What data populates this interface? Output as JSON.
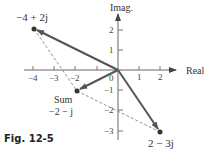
{
  "figure": {
    "caption": "Fig. 12-5",
    "axes": {
      "x_label": "Real",
      "y_label": "Imag.",
      "x_ticks": [
        "−4",
        "−3",
        "−2",
        "1",
        "2"
      ],
      "y_ticks": [
        "2",
        "1",
        "0",
        "−1",
        "−2",
        "−3"
      ]
    },
    "points": {
      "a": {
        "label": "−4 + 2j",
        "re": -4,
        "im": 2
      },
      "b": {
        "label": "2 − 3j",
        "re": 2,
        "im": -3
      },
      "sum": {
        "label_line1": "Sum",
        "label_line2": "−2 − j",
        "re": -2,
        "im": -1
      }
    },
    "colors": {
      "vector": "#555555",
      "dashed": "#777777",
      "axis": "#666666",
      "point": "#333333"
    }
  }
}
